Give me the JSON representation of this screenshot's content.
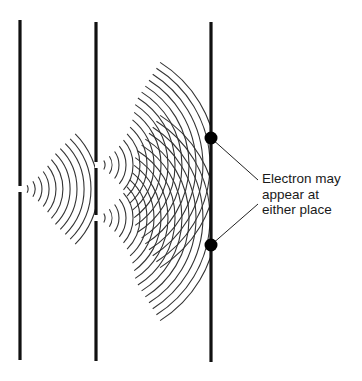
{
  "diagram": {
    "annotation": {
      "lines": [
        "Electron may",
        "appear at",
        "either place"
      ]
    },
    "colors": {
      "barrier": "#111111",
      "wave": "#333333",
      "dot": "#000000",
      "text": "#1a1a1a",
      "background": "#ffffff"
    },
    "barriers": [
      {
        "name": "source-barrier",
        "x": 20,
        "top": 20,
        "bottom": 360,
        "slits": [
          189
        ]
      },
      {
        "name": "double-slit-barrier",
        "x": 96,
        "top": 22,
        "bottom": 361,
        "slits": [
          165,
          218
        ]
      },
      {
        "name": "detection-screen",
        "x": 211,
        "top": 22,
        "bottom": 362,
        "slits": []
      }
    ],
    "detection_points": [
      {
        "x": 211,
        "y": 138
      },
      {
        "x": 211,
        "y": 245
      }
    ],
    "leader_lines": [
      {
        "x1": 211,
        "y1": 138,
        "x2": 258,
        "y2": 180
      },
      {
        "x1": 211,
        "y1": 245,
        "x2": 258,
        "y2": 204
      }
    ]
  }
}
